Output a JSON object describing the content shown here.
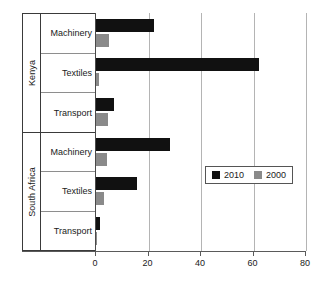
{
  "chart_data": {
    "type": "bar",
    "orientation": "horizontal",
    "title": "",
    "xlabel": "",
    "ylabel": "",
    "xlim": [
      0,
      80
    ],
    "xticks": [
      0,
      20,
      40,
      60,
      80
    ],
    "xtick_labels": [
      "0",
      "20",
      "40",
      "60",
      "80"
    ],
    "grid": true,
    "grid_axis": "x",
    "legend_position": "center-right-inside",
    "groups": [
      {
        "name": "Kenya",
        "categories": [
          "Machinery",
          "Textiles",
          "Transport"
        ]
      },
      {
        "name": "South Africa",
        "categories": [
          "Machinery",
          "Textiles",
          "Transport"
        ]
      }
    ],
    "categories": [
      "Kenya - Machinery",
      "Kenya - Textiles",
      "Kenya - Transport",
      "South Africa - Machinery",
      "South Africa - Textiles",
      "South Africa - Transport"
    ],
    "series": [
      {
        "name": "2010",
        "color": "#111111",
        "values": [
          22,
          62,
          7,
          28,
          15.5,
          1.5
        ]
      },
      {
        "name": "2000",
        "color": "#8a8a8a",
        "values": [
          5,
          1,
          4.5,
          4,
          3,
          0.3
        ]
      }
    ]
  },
  "legend": {
    "items": [
      {
        "label": "2010",
        "color": "#111111"
      },
      {
        "label": "2000",
        "color": "#8a8a8a"
      }
    ]
  },
  "axis": {
    "ticks": [
      {
        "label": "0",
        "value": 0
      },
      {
        "label": "20",
        "value": 20
      },
      {
        "label": "40",
        "value": 40
      },
      {
        "label": "60",
        "value": 60
      },
      {
        "label": "80",
        "value": 80
      }
    ]
  },
  "labels": {
    "group_kenya": "Kenya",
    "group_south_africa": "South Africa",
    "kenya": {
      "machinery": "Machinery",
      "textiles": "Textiles",
      "transport": "Transport"
    },
    "south_africa": {
      "machinery": "Machinery",
      "textiles": "Textiles",
      "transport": "Transport"
    }
  }
}
